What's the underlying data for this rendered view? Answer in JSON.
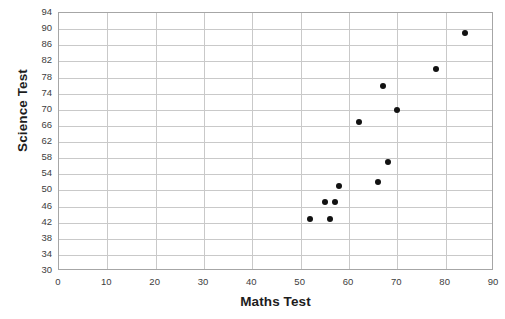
{
  "chart_data": {
    "type": "scatter",
    "title": "",
    "xlabel": "Maths Test",
    "ylabel": "Science Test",
    "xlim": [
      0,
      90
    ],
    "ylim": [
      30,
      94
    ],
    "xticks": [
      0,
      10,
      20,
      30,
      40,
      50,
      60,
      70,
      80,
      90
    ],
    "yticks": [
      30,
      34,
      38,
      42,
      46,
      50,
      54,
      58,
      62,
      66,
      70,
      74,
      78,
      82,
      86,
      90,
      94
    ],
    "grid": true,
    "legend": null,
    "marker_color": "#121212",
    "gridline_color": "#c9c9c9",
    "border_color": "#a6a6a6",
    "series": [
      {
        "name": "",
        "points": [
          {
            "x": 52,
            "y": 43
          },
          {
            "x": 55,
            "y": 47
          },
          {
            "x": 56,
            "y": 43
          },
          {
            "x": 57,
            "y": 47
          },
          {
            "x": 58,
            "y": 51
          },
          {
            "x": 62,
            "y": 67
          },
          {
            "x": 66,
            "y": 52
          },
          {
            "x": 67,
            "y": 76
          },
          {
            "x": 68,
            "y": 57
          },
          {
            "x": 70,
            "y": 70
          },
          {
            "x": 78,
            "y": 80
          },
          {
            "x": 84,
            "y": 89
          }
        ]
      }
    ]
  }
}
